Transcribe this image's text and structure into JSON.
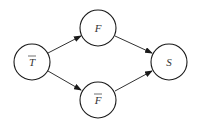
{
  "diagram": {
    "type": "directed-graph",
    "nodes": [
      {
        "id": "T_bar",
        "label": "T",
        "overbar": true,
        "cx": 32,
        "cy": 62
      },
      {
        "id": "F",
        "label": "F",
        "overbar": false,
        "cx": 98,
        "cy": 28
      },
      {
        "id": "F_bar",
        "label": "F",
        "overbar": true,
        "cx": 98,
        "cy": 100
      },
      {
        "id": "S",
        "label": "S",
        "overbar": false,
        "cx": 169,
        "cy": 62
      }
    ],
    "edges": [
      {
        "from": "T_bar",
        "to": "F"
      },
      {
        "from": "T_bar",
        "to": "F_bar"
      },
      {
        "from": "F",
        "to": "S"
      },
      {
        "from": "F_bar",
        "to": "S"
      }
    ],
    "colors": {
      "stroke": "#1a1a1a",
      "fill": "#ffffff",
      "text": "#333333"
    }
  }
}
